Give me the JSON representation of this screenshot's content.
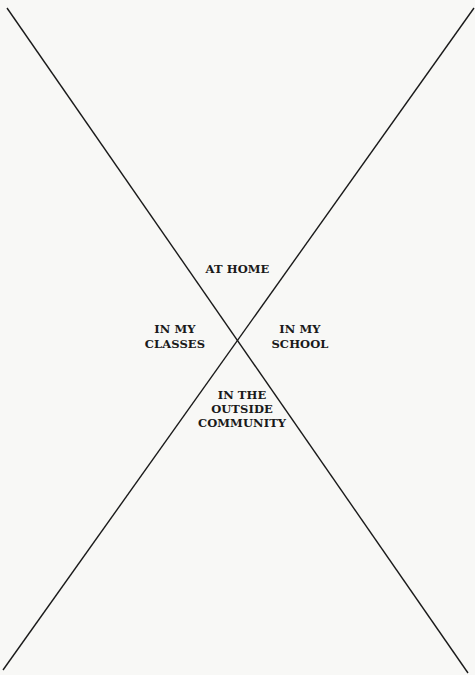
{
  "diagram": {
    "type": "x-quadrant",
    "line_color": "#1a1a1a",
    "background": "#f8f8f6",
    "quadrants": {
      "top": {
        "lines": [
          "AT HOME"
        ]
      },
      "left": {
        "lines": [
          "IN MY",
          "CLASSES"
        ]
      },
      "right": {
        "lines": [
          "IN MY",
          "SCHOOL"
        ]
      },
      "bottom": {
        "lines": [
          "IN THE",
          "OUTSIDE",
          "COMMUNITY"
        ]
      }
    }
  }
}
